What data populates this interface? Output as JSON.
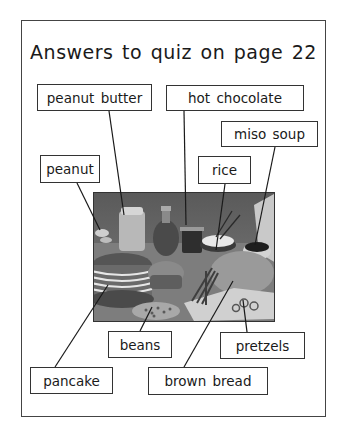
{
  "title": "Answers to quiz on page 22",
  "photo": {
    "description": "grayscale photo of breakfast foods: peanut butter jar, syrup bottle, hot chocolate, rice bowl with chopsticks, miso soup, stack of pancakes, muffin, bread loaf, pretzels, beans"
  },
  "labels": [
    {
      "id": "peanut-butter",
      "text": "peanut butter"
    },
    {
      "id": "hot-chocolate",
      "text": "hot chocolate"
    },
    {
      "id": "miso-soup",
      "text": "miso soup"
    },
    {
      "id": "peanut",
      "text": "peanut"
    },
    {
      "id": "rice",
      "text": "rice"
    },
    {
      "id": "beans",
      "text": "beans"
    },
    {
      "id": "pretzels",
      "text": "pretzels"
    },
    {
      "id": "pancake",
      "text": "pancake"
    },
    {
      "id": "brown-bread",
      "text": "brown bread"
    }
  ],
  "colors": {
    "border": "#333333",
    "background": "#ffffff",
    "text": "#1a1a1a"
  }
}
